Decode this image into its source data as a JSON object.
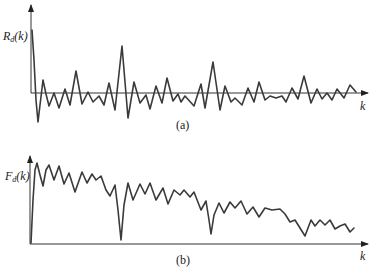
{
  "figure": {
    "colors": {
      "line": "#3a3a3a",
      "axis": "#333333",
      "background": "#ffffff"
    },
    "panels": [
      {
        "id": "a",
        "caption": "(a)",
        "ylabel_main": "R",
        "ylabel_sub": "d",
        "ylabel_arg": "(k)",
        "xlabel": "k",
        "trace_points": "32,30 34,60 36,100 38,122 40,105 43,80 46,94 49,106 54,93 59,108 65,89 70,105 76,71 82,104 88,92 93,102 99,96 104,105 109,83 115,110 122,46 128,118 134,82 140,103 146,95 150,109 156,86 162,103 167,78 173,101 178,94 181,102 185,96 194,106 201,84 205,108 213,62 220,110 225,86 231,102 235,98 242,105 248,88 254,102 259,82 265,100 270,96 276,98 282,96 286,102 292,88 298,99 304,76 311,103 317,89 322,99 327,93 332,100 337,89 344,98 350,85 356,92"
      },
      {
        "id": "b",
        "caption": "(b)",
        "ylabel_main": "F",
        "ylabel_sub": "d",
        "ylabel_arg": "(k)",
        "xlabel": "k",
        "trace_points": "31,243 33,200 35,170 37,163 40,175 43,186 46,170 49,165 54,180 59,166 64,184 69,173 75,192 82,172 87,183 92,174 96,180 101,176 106,190 110,196 115,185 118,210 121,240 124,205 128,183 133,200 140,184 145,194 150,183 156,200 163,188 168,204 174,190 180,195 184,190 190,197 194,192 201,210 206,201 209,220 211,234 214,215 219,203 224,213 230,202 235,208 241,201 247,214 253,207 259,217 265,208 272,210 280,209 285,214 290,222 295,220 300,228 305,236 311,220 315,226 320,220 325,225 330,220 335,229 340,226 345,224 350,232 354,228"
      }
    ]
  }
}
